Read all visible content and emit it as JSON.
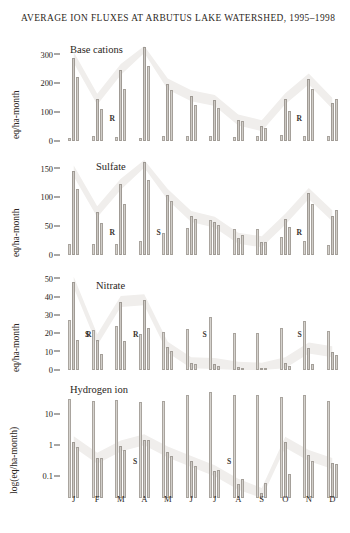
{
  "title": "AVERAGE ION FLUXES AT ARBUTUS LAKE WATERSHED, 1995–1998",
  "months": [
    "J",
    "F",
    "M",
    "A",
    "M",
    "J",
    "J",
    "A",
    "S",
    "O",
    "N",
    "D"
  ],
  "panels": [
    {
      "id": "base",
      "label": "Base cations",
      "axis_title": "eq/ha-month",
      "ticks": [
        "300",
        "200",
        "100",
        "0"
      ]
    },
    {
      "id": "sulfate",
      "label": "Sulfate",
      "axis_title": "eq/ha-month",
      "ticks": [
        "150",
        "100",
        "50",
        "0"
      ]
    },
    {
      "id": "nitrate",
      "label": "Nitrate",
      "axis_title": "eq/ha-month",
      "ticks": [
        "50",
        "40",
        "30",
        "20",
        "10",
        "0"
      ]
    },
    {
      "id": "hydrogen",
      "label": "Hydrogen ion",
      "axis_title": "log(eq/ha-month)",
      "ticks": [
        "10",
        "1",
        "0.1"
      ]
    }
  ],
  "chart_data": [
    {
      "type": "bar",
      "title": "Base cations",
      "xlabel": "",
      "ylabel": "eq/ha-month",
      "ylim": [
        0,
        330
      ],
      "yticks": [
        0,
        100,
        200,
        300
      ],
      "scale": "linear",
      "grid": false,
      "legend": "none",
      "categories": [
        "J",
        "F",
        "M",
        "A",
        "M",
        "J",
        "J",
        "A",
        "S",
        "O",
        "N",
        "D"
      ],
      "series": [
        {
          "name": "bar1",
          "values": [
            10,
            16,
            14,
            12,
            18,
            16,
            16,
            14,
            17,
            21,
            16,
            17
          ]
        },
        {
          "name": "bar2",
          "values": [
            290,
            145,
            248,
            325,
            198,
            157,
            141,
            73,
            53,
            147,
            215,
            131
          ]
        },
        {
          "name": "bar3",
          "values": [
            222,
            111,
            179,
            259,
            178,
            126,
            115,
            70,
            45,
            104,
            179,
            145
          ]
        }
      ],
      "annotations": [
        {
          "text": "R",
          "category": "F",
          "side": "right"
        },
        {
          "text": "R",
          "category": "N",
          "side": "left"
        }
      ]
    },
    {
      "type": "bar",
      "title": "Sulfate",
      "xlabel": "",
      "ylabel": "eq/ha-month",
      "ylim": [
        0,
        165
      ],
      "yticks": [
        0,
        50,
        100,
        150
      ],
      "scale": "linear",
      "grid": false,
      "legend": "none",
      "categories": [
        "J",
        "F",
        "M",
        "A",
        "M",
        "J",
        "J",
        "A",
        "S",
        "O",
        "N",
        "D"
      ],
      "series": [
        {
          "name": "bar1",
          "values": [
            20,
            19,
            20,
            25,
            38,
            47,
            60,
            46,
            45,
            32,
            25,
            18
          ]
        },
        {
          "name": "bar2",
          "values": [
            146,
            75,
            123,
            161,
            105,
            67,
            57,
            29,
            23,
            62,
            107,
            68
          ]
        },
        {
          "name": "bar3",
          "values": [
            114,
            55,
            88,
            131,
            93,
            63,
            53,
            34,
            22,
            49,
            89,
            79
          ]
        }
      ],
      "annotations": [
        {
          "text": "R",
          "category": "F",
          "side": "right"
        },
        {
          "text": "S",
          "category": "A",
          "side": "right"
        },
        {
          "text": "R",
          "category": "N",
          "side": "left"
        }
      ]
    },
    {
      "type": "bar",
      "title": "Nitrate",
      "xlabel": "",
      "ylabel": "eq/ha-month",
      "ylim": [
        0,
        52
      ],
      "yticks": [
        0,
        10,
        20,
        30,
        40,
        50
      ],
      "scale": "linear",
      "grid": false,
      "legend": "none",
      "categories": [
        "J",
        "F",
        "M",
        "A",
        "M",
        "J",
        "J",
        "A",
        "S",
        "O",
        "N",
        "D"
      ],
      "series": [
        {
          "name": "bar1",
          "values": [
            27.5,
            22.0,
            24.0,
            19.5,
            21.0,
            22.5,
            29.0,
            20.0,
            20.5,
            23.0,
            27.0,
            21.5
          ]
        },
        {
          "name": "bar2",
          "values": [
            48.0,
            16.5,
            37.5,
            38.5,
            12.5,
            4.0,
            3.5,
            1.5,
            1.0,
            4.0,
            12.0,
            10.0
          ]
        },
        {
          "name": "bar3",
          "values": [
            16.5,
            8.5,
            16.0,
            23.0,
            10.5,
            3.2,
            2.0,
            1.2,
            0.8,
            2.0,
            3.5,
            8.0
          ]
        }
      ],
      "annotations": [
        {
          "text": "R",
          "category": "J",
          "side": "right"
        },
        {
          "text": "S",
          "category": "F",
          "side": "left"
        },
        {
          "text": "R",
          "category": "M",
          "side": "right"
        },
        {
          "text": "S",
          "category": "J2",
          "side": "left"
        },
        {
          "text": "S",
          "category": "O",
          "side": "right"
        }
      ]
    },
    {
      "type": "bar",
      "title": "Hydrogen ion",
      "xlabel": "",
      "ylabel": "log(eq/ha-month)",
      "ylim": [
        0.02,
        60
      ],
      "yticks": [
        0.1,
        1,
        10
      ],
      "scale": "log",
      "grid": false,
      "legend": "none",
      "categories": [
        "J",
        "F",
        "M",
        "A",
        "M",
        "J",
        "J",
        "A",
        "S",
        "O",
        "N",
        "D"
      ],
      "series": [
        {
          "name": "bar1",
          "values": [
            30,
            26,
            29,
            25,
            27,
            40,
            52,
            42,
            40,
            35,
            43,
            27
          ]
        },
        {
          "name": "bar2",
          "values": [
            1.3,
            0.38,
            0.95,
            1.5,
            0.6,
            0.3,
            0.15,
            0.055,
            0.028,
            1.25,
            0.47,
            0.26
          ]
        },
        {
          "name": "bar3",
          "values": [
            0.9,
            0.4,
            0.7,
            1.5,
            0.45,
            0.21,
            0.155,
            0.08,
            0.06,
            0.115,
            0.3,
            0.25
          ]
        }
      ],
      "annotations": [
        {
          "text": "S",
          "category": "M",
          "side": "right"
        },
        {
          "text": "S",
          "category": "J2",
          "side": "right"
        }
      ]
    }
  ]
}
